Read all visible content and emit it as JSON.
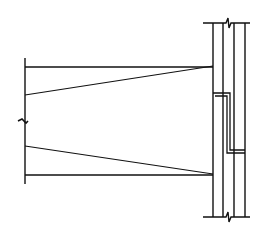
{
  "diagram": {
    "type": "structural-connection-detail",
    "stroke_color": "#111111",
    "background": "#ffffff",
    "beam": {
      "left_x": 25,
      "right_x": 213,
      "top_flange_y": 67,
      "bottom_flange_y": 175,
      "web_top_left_y": 95,
      "web_bottom_left_y": 146,
      "end_line": {
        "x": 25,
        "y1": 58,
        "y2": 184
      },
      "break_mark_y": 121
    },
    "column": {
      "lines_x": [
        213,
        223,
        234,
        245
      ],
      "top_y": 23,
      "bottom_y": 217,
      "cap_left_x": 203,
      "cap_right_x": 250,
      "break_mark_x": 228
    },
    "plate": {
      "outer": [
        [
          213,
          93
        ],
        [
          230,
          93
        ],
        [
          230,
          150
        ],
        [
          245,
          150
        ]
      ],
      "inner": [
        [
          215,
          96
        ],
        [
          227,
          96
        ],
        [
          227,
          153
        ],
        [
          245,
          153
        ]
      ]
    }
  }
}
